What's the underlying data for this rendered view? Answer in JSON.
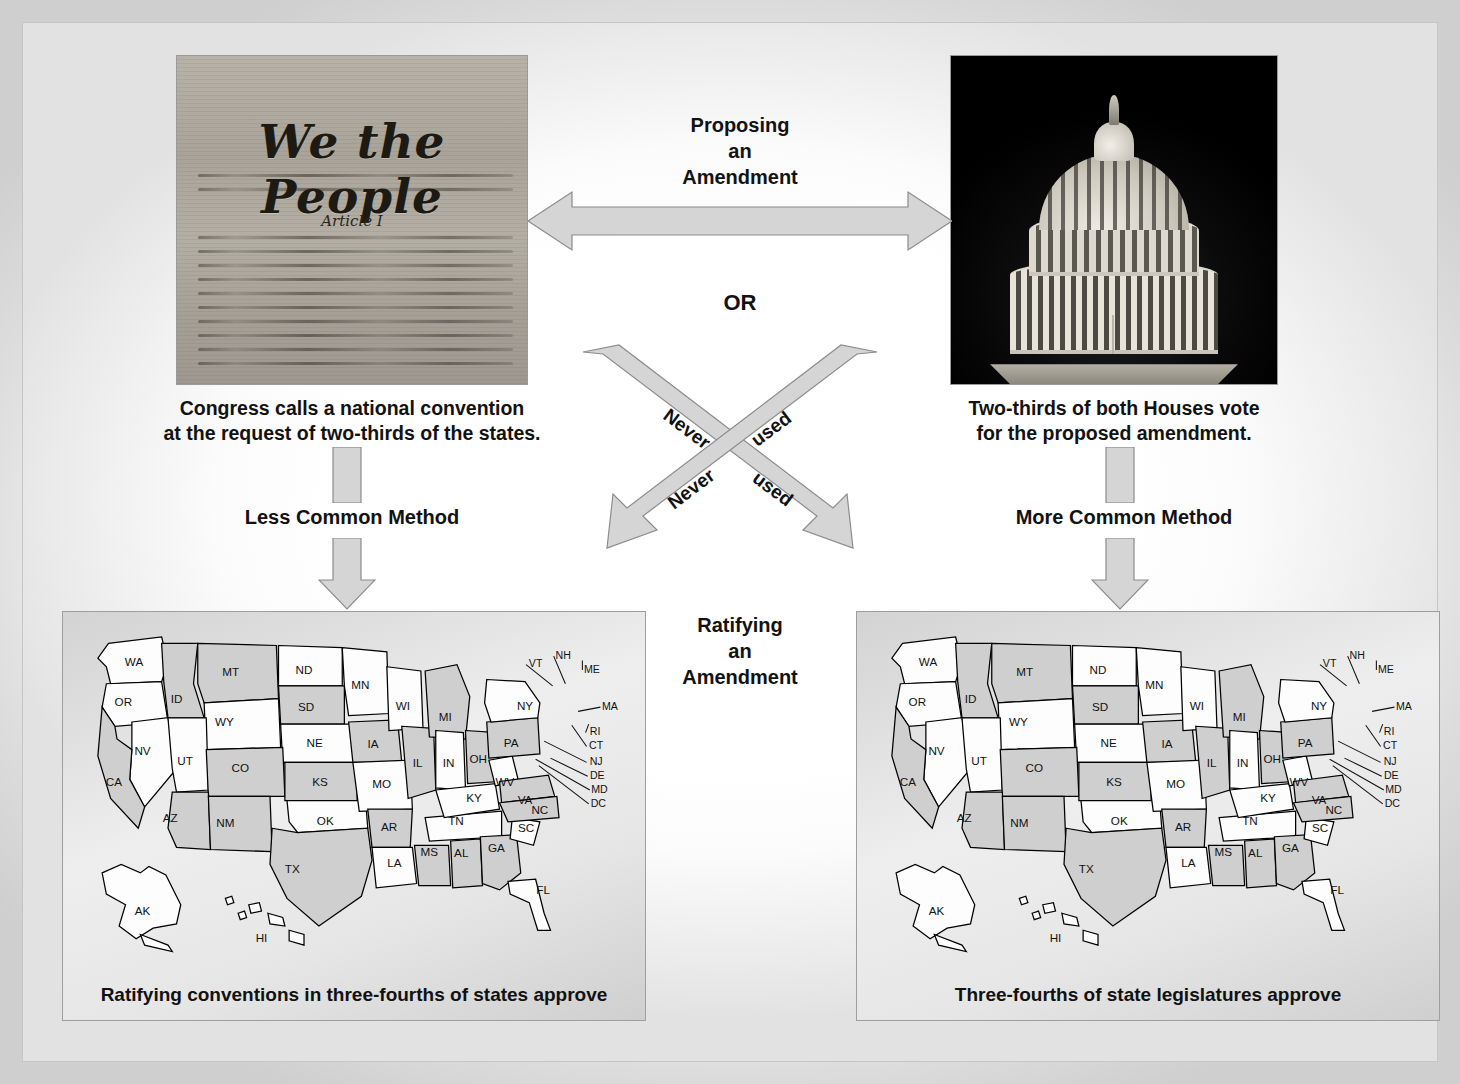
{
  "diagram": {
    "accent_gray": "#d5d5d5",
    "arrow_border": "#8c8c8c",
    "panel_bg": "#e6e6e6"
  },
  "proposing": {
    "title_line1": "Proposing",
    "title_line2": "an",
    "title_line3": "Amendment",
    "or_label": "OR"
  },
  "ratifying": {
    "title_line1": "Ratifying",
    "title_line2": "an",
    "title_line3": "Amendment"
  },
  "left_branch": {
    "photo_alt": "constitution-we-the-people",
    "photo_heading": "We the People",
    "photo_subtext": "Article I",
    "caption_line1": "Congress calls a national convention",
    "caption_line2": "at the request of two-thirds of the states.",
    "method_label": "Less Common Method",
    "map_caption": "Ratifying conventions in three-fourths of states approve"
  },
  "right_branch": {
    "photo_alt": "us-capitol-dome-at-night",
    "caption_line1": "Two-thirds of both Houses vote",
    "caption_line2": "for the proposed amendment.",
    "method_label": "More Common Method",
    "map_caption": "Three-fourths of state legislatures approve"
  },
  "cross_arrows": [
    {
      "id": "upper-cross",
      "word1": "Never",
      "word2": "used"
    },
    {
      "id": "lower-cross",
      "word1": "Never",
      "word2": "used"
    }
  ],
  "map": {
    "states": [
      {
        "abbr": "WA",
        "x": 52,
        "y": 40,
        "fill": "w"
      },
      {
        "abbr": "OR",
        "x": 42,
        "y": 78,
        "fill": "w"
      },
      {
        "abbr": "ID",
        "x": 92,
        "y": 75,
        "fill": "g"
      },
      {
        "abbr": "MT",
        "x": 143,
        "y": 50,
        "fill": "g"
      },
      {
        "abbr": "ND",
        "x": 212,
        "y": 48,
        "fill": "w"
      },
      {
        "abbr": "SD",
        "x": 214,
        "y": 83,
        "fill": "g"
      },
      {
        "abbr": "NE",
        "x": 222,
        "y": 117,
        "fill": "w"
      },
      {
        "abbr": "WY",
        "x": 137,
        "y": 97,
        "fill": "w"
      },
      {
        "abbr": "NV",
        "x": 60,
        "y": 124,
        "fill": "w"
      },
      {
        "abbr": "UT",
        "x": 100,
        "y": 134,
        "fill": "w"
      },
      {
        "abbr": "CO",
        "x": 152,
        "y": 140,
        "fill": "g"
      },
      {
        "abbr": "KS",
        "x": 227,
        "y": 153,
        "fill": "g"
      },
      {
        "abbr": "CA",
        "x": 33,
        "y": 153,
        "fill": "g"
      },
      {
        "abbr": "AZ",
        "x": 86,
        "y": 187,
        "fill": "g"
      },
      {
        "abbr": "NM",
        "x": 138,
        "y": 192,
        "fill": "g"
      },
      {
        "abbr": "OK",
        "x": 232,
        "y": 190,
        "fill": "w"
      },
      {
        "abbr": "TX",
        "x": 201,
        "y": 235,
        "fill": "g"
      },
      {
        "abbr": "MN",
        "x": 265,
        "y": 62,
        "fill": "w"
      },
      {
        "abbr": "IA",
        "x": 277,
        "y": 118,
        "fill": "g"
      },
      {
        "abbr": "MO",
        "x": 285,
        "y": 155,
        "fill": "w"
      },
      {
        "abbr": "AR",
        "x": 292,
        "y": 196,
        "fill": "g"
      },
      {
        "abbr": "LA",
        "x": 297,
        "y": 230,
        "fill": "w"
      },
      {
        "abbr": "WI",
        "x": 305,
        "y": 82,
        "fill": "w"
      },
      {
        "abbr": "IL",
        "x": 319,
        "y": 135,
        "fill": "g"
      },
      {
        "abbr": "MS",
        "x": 330,
        "y": 219,
        "fill": "g"
      },
      {
        "abbr": "MI",
        "x": 345,
        "y": 92,
        "fill": "g"
      },
      {
        "abbr": "IN",
        "x": 348,
        "y": 135,
        "fill": "w"
      },
      {
        "abbr": "TN",
        "x": 355,
        "y": 190,
        "fill": "w"
      },
      {
        "abbr": "AL",
        "x": 360,
        "y": 220,
        "fill": "g"
      },
      {
        "abbr": "OH",
        "x": 376,
        "y": 132,
        "fill": "g"
      },
      {
        "abbr": "KY",
        "x": 372,
        "y": 168,
        "fill": "w"
      },
      {
        "abbr": "GA",
        "x": 393,
        "y": 215,
        "fill": "g"
      },
      {
        "abbr": "WV",
        "x": 401,
        "y": 153,
        "fill": "w"
      },
      {
        "abbr": "PA",
        "x": 407,
        "y": 117,
        "fill": "g"
      },
      {
        "abbr": "VA",
        "x": 420,
        "y": 170,
        "fill": "g"
      },
      {
        "abbr": "SC",
        "x": 421,
        "y": 197,
        "fill": "w"
      },
      {
        "abbr": "NC",
        "x": 434,
        "y": 180,
        "fill": "g"
      },
      {
        "abbr": "NY",
        "x": 420,
        "y": 82,
        "fill": "w"
      },
      {
        "abbr": "FL",
        "x": 437,
        "y": 255,
        "fill": "w"
      },
      {
        "abbr": "AK",
        "x": 60,
        "y": 275,
        "fill": "w"
      },
      {
        "abbr": "HI",
        "x": 172,
        "y": 300,
        "fill": "w"
      }
    ],
    "leader_labels": [
      {
        "abbr": "VT",
        "x": 430,
        "y": 42
      },
      {
        "abbr": "NH",
        "x": 456,
        "y": 34
      },
      {
        "abbr": "ME",
        "x": 483,
        "y": 47
      },
      {
        "abbr": "MA",
        "x": 500,
        "y": 82
      },
      {
        "abbr": "RI",
        "x": 486,
        "y": 106
      },
      {
        "abbr": "CT",
        "x": 487,
        "y": 119
      },
      {
        "abbr": "NJ",
        "x": 487,
        "y": 134
      },
      {
        "abbr": "DE",
        "x": 488,
        "y": 147
      },
      {
        "abbr": "MD",
        "x": 490,
        "y": 160
      },
      {
        "abbr": "DC",
        "x": 489,
        "y": 173
      }
    ]
  }
}
